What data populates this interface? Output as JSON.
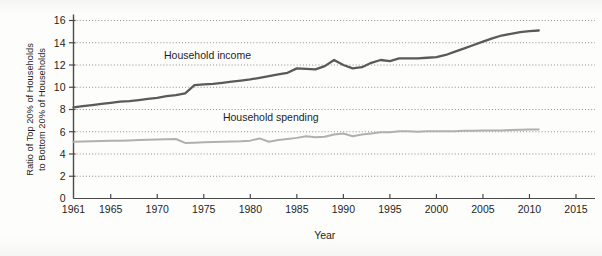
{
  "chart_data": {
    "type": "line",
    "title": "",
    "subtitle": "",
    "xlabel": "Year",
    "ylabel": "Ratio of Top 20% of Households to Bottom 20% of Households",
    "ylabel_line1": "Ratio of Top 20% of Households",
    "ylabel_line2": "to Bottom 20% of Households",
    "xlim": [
      1961,
      2015
    ],
    "ylim": [
      0,
      16
    ],
    "yticks": [
      0,
      2,
      4,
      6,
      8,
      10,
      12,
      14,
      16
    ],
    "ytick_labels": [
      "0",
      "2",
      "4",
      "6",
      "8",
      "10",
      "12",
      "14",
      "16"
    ],
    "xticks": [
      1961,
      1965,
      1970,
      1975,
      1980,
      1985,
      1990,
      1995,
      2000,
      2005,
      2010,
      2015
    ],
    "xtick_labels": [
      "1961",
      "1965",
      "1970",
      "1975",
      "1980",
      "1985",
      "1990",
      "1995",
      "2000",
      "2005",
      "2010",
      "2015"
    ],
    "grid": "horizontal-dotted",
    "legend_position": "inline-annotations",
    "colors": {
      "income": "#5a5a5a",
      "spending": "#b0b0b0",
      "axis": "#4a4a4a",
      "grid": "#8d8d8d",
      "background": "#fdfdfc"
    },
    "series": [
      {
        "name": "Household income",
        "color": "#5a5a5a",
        "label_x": 1975.4,
        "label_y": 12.55,
        "x": [
          1961,
          1962,
          1963,
          1964,
          1965,
          1966,
          1967,
          1968,
          1969,
          1970,
          1971,
          1972,
          1973,
          1974,
          1975,
          1976,
          1977,
          1978,
          1979,
          1980,
          1981,
          1982,
          1983,
          1984,
          1985,
          1986,
          1987,
          1988,
          1989,
          1990,
          1991,
          1992,
          1993,
          1994,
          1995,
          1996,
          1997,
          1998,
          1999,
          2000,
          2001,
          2002,
          2003,
          2004,
          2005,
          2006,
          2007,
          2008,
          2009,
          2010,
          2011
        ],
        "values": [
          8.2,
          8.3,
          8.4,
          8.5,
          8.6,
          8.7,
          8.75,
          8.85,
          8.95,
          9.05,
          9.2,
          9.3,
          9.45,
          10.2,
          10.25,
          10.3,
          10.4,
          10.5,
          10.6,
          10.7,
          10.85,
          11.0,
          11.15,
          11.3,
          11.7,
          11.65,
          11.6,
          11.9,
          12.45,
          12.0,
          11.7,
          11.8,
          12.2,
          12.45,
          12.35,
          12.6,
          12.6,
          12.6,
          12.65,
          12.7,
          12.9,
          13.2,
          13.5,
          13.8,
          14.1,
          14.4,
          14.65,
          14.8,
          14.95,
          15.05,
          15.1
        ]
      },
      {
        "name": "Household spending",
        "color": "#b0b0b0",
        "label_x": 1982.2,
        "label_y": 6.95,
        "x": [
          1961,
          1962,
          1963,
          1964,
          1965,
          1966,
          1967,
          1968,
          1969,
          1970,
          1971,
          1972,
          1973,
          1974,
          1975,
          1976,
          1977,
          1978,
          1979,
          1980,
          1981,
          1982,
          1983,
          1984,
          1985,
          1986,
          1987,
          1988,
          1989,
          1990,
          1991,
          1992,
          1993,
          1994,
          1995,
          1996,
          1997,
          1998,
          1999,
          2000,
          2001,
          2002,
          2003,
          2004,
          2005,
          2006,
          2007,
          2008,
          2009,
          2010,
          2011
        ],
        "values": [
          5.1,
          5.12,
          5.14,
          5.16,
          5.18,
          5.2,
          5.22,
          5.25,
          5.28,
          5.3,
          5.33,
          5.35,
          5.0,
          5.02,
          5.05,
          5.08,
          5.1,
          5.12,
          5.15,
          5.2,
          5.4,
          5.1,
          5.25,
          5.35,
          5.45,
          5.6,
          5.5,
          5.55,
          5.75,
          5.85,
          5.6,
          5.75,
          5.85,
          5.95,
          5.95,
          6.05,
          6.05,
          6.0,
          6.05,
          6.05,
          6.05,
          6.05,
          6.08,
          6.1,
          6.12,
          6.12,
          6.12,
          6.15,
          6.18,
          6.2,
          6.2
        ]
      }
    ]
  }
}
